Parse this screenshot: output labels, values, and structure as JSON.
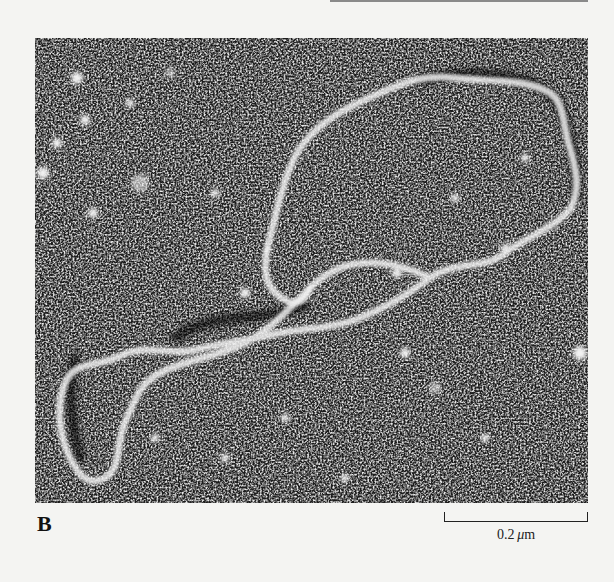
{
  "figure": {
    "panel_label": "B",
    "scale_bar": {
      "value": "0.2",
      "unit_prefix": "μ",
      "unit": "m",
      "label": "0.2 μm"
    },
    "colors": {
      "page_background": "#f4f4f2",
      "micrograph_dark": "#1a1a1a",
      "micrograph_light": "#e8e8e8",
      "text": "#111111"
    }
  }
}
